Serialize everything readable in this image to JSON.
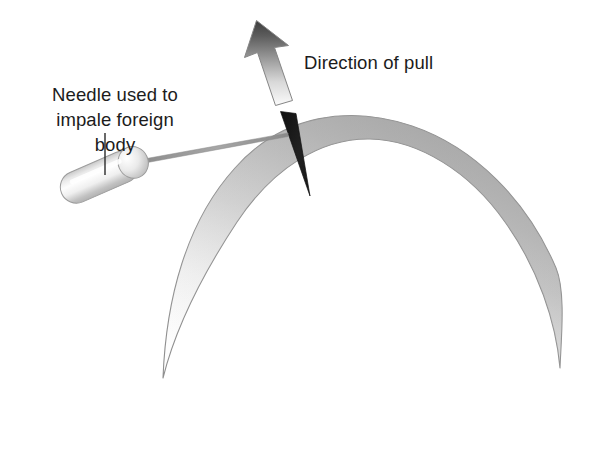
{
  "figure": {
    "background_color": "#ffffff",
    "width": 596,
    "height": 449
  },
  "labels": {
    "direction_of_pull": "Direction of pull",
    "needle_line_1": "Needle used to",
    "needle_line_2": "impale foreign body"
  },
  "colors": {
    "text": "#1c1c1c",
    "outline": "#8f8f8f",
    "foreign_body": "#141414",
    "arrow_dark": "#4a4a4a",
    "arrow_light": "#f7f7f7",
    "tissue_dark": "#aeaeae",
    "tissue_light": "#fbfbfb",
    "needle_hub_light": "#fdfdfd",
    "needle_hub_shadow": "#bdbdbd",
    "needle_shaft": "#9a9a9a",
    "leader_line": "#2a2a2a"
  },
  "elements": {
    "tissue_dome": "curved tissue band (crescent) representing cornea in cross-section",
    "foreign_body": "black tapered wedge embedded in tissue surface",
    "pull_arrow": "gradient arrow pointing up indicating direction of pull",
    "needle": "needle with capsule hub, collar and thin shaft",
    "leader_line": "vertical leader line from needle caption to hub"
  },
  "geometry": {
    "dome_apex_y": 122,
    "dome_inner_low_y": 197,
    "left_horn": [
      163,
      378
    ],
    "right_horn": [
      560,
      368
    ],
    "foreign_body_tip": [
      310,
      196
    ],
    "foreign_body_base": [
      281,
      112
    ],
    "arrow_tip_y": 20,
    "arrow_base_y": 103,
    "needle_hub_from": [
      57,
      195
    ],
    "needle_hub_to": [
      148,
      155
    ],
    "needle_shaft_tip": [
      288,
      135
    ],
    "leader_line_x": 105,
    "leader_line_from_y": 133,
    "leader_line_to_y": 175
  }
}
